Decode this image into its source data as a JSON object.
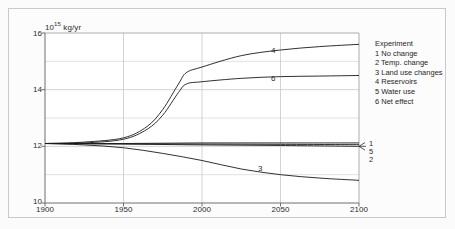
{
  "chart_data": {
    "type": "line",
    "title": "",
    "xlabel": "",
    "ylabel": "10^15 kg/yr",
    "ylabel_mantissa": "10",
    "ylabel_exponent": "15",
    "ylabel_unit": " kg/yr",
    "xlim": [
      1900,
      2100
    ],
    "ylim": [
      10,
      16
    ],
    "xticks": [
      "1900",
      "1950",
      "2000",
      "2050",
      "2100"
    ],
    "xtick_values": [
      1900,
      1950,
      2000,
      2050,
      2100
    ],
    "yticks": [
      "10",
      "12",
      "14",
      "16"
    ],
    "ytick_values": [
      10,
      12,
      14,
      16
    ],
    "yminor_values": [
      11,
      13,
      15
    ],
    "grid": true,
    "legend_position": "right",
    "legend_title": "Experiment",
    "series": [
      {
        "name": "1 No change",
        "number": "1",
        "label_position": "right-brace",
        "x": [
          1900,
          1950,
          2000,
          2050,
          2100
        ],
        "values": [
          12.1,
          12.1,
          12.12,
          12.12,
          12.12
        ]
      },
      {
        "name": "2 Temp. change",
        "number": "2",
        "label_position": "right-brace",
        "x": [
          1900,
          1950,
          2000,
          2050,
          2100
        ],
        "values": [
          12.1,
          12.08,
          12.05,
          12.03,
          12.0
        ]
      },
      {
        "name": "3 Land use changes",
        "number": "3",
        "label_position": "inline",
        "x": [
          1900,
          1925,
          1950,
          1975,
          2000,
          2025,
          2050,
          2075,
          2100
        ],
        "values": [
          12.1,
          12.05,
          11.95,
          11.75,
          11.5,
          11.2,
          11.0,
          10.88,
          10.8
        ]
      },
      {
        "name": "4 Reservoirs",
        "number": "4",
        "label_position": "inline",
        "x": [
          1900,
          1925,
          1950,
          1965,
          1975,
          1985,
          1990,
          2000,
          2025,
          2050,
          2075,
          2100
        ],
        "values": [
          12.1,
          12.15,
          12.3,
          12.7,
          13.3,
          14.2,
          14.6,
          14.8,
          15.2,
          15.4,
          15.52,
          15.6
        ]
      },
      {
        "name": "5 Water use",
        "number": "5",
        "label_position": "right-brace",
        "x": [
          1900,
          1950,
          2000,
          2050,
          2100
        ],
        "values": [
          12.1,
          12.09,
          12.08,
          12.07,
          12.06
        ]
      },
      {
        "name": "6 Net effect",
        "number": "6",
        "label_position": "inline",
        "x": [
          1900,
          1925,
          1950,
          1965,
          1975,
          1985,
          1990,
          2000,
          2025,
          2050,
          2075,
          2100
        ],
        "values": [
          12.1,
          12.12,
          12.25,
          12.6,
          13.1,
          13.9,
          14.2,
          14.28,
          14.4,
          14.46,
          14.48,
          14.5
        ]
      }
    ],
    "annotations": [
      {
        "text": "4",
        "x": 2028,
        "y": 15.33
      },
      {
        "text": "6",
        "x": 2028,
        "y": 14.55
      },
      {
        "text": "3",
        "x": 2020,
        "y": 11.22
      }
    ],
    "right_brace_labels": [
      "1",
      "5",
      "2"
    ],
    "colors": {
      "curve": "#1a1a1a",
      "grid": "#d0d0d0",
      "axis": "#808080",
      "text": "#2b2b2b",
      "plot_background": "#ffffff",
      "figure_background": "#fcfcfc",
      "frame_border": "#c9c9c9"
    }
  },
  "legend": {
    "title": "Experiment",
    "items": [
      "1 No change",
      "2 Temp. change",
      "3 Land use changes",
      "4 Reservoirs",
      "5 Water use",
      "6 Net effect"
    ]
  },
  "axes": {
    "y_unit_mantissa": "10",
    "y_unit_exponent": "15",
    "y_unit_rest": " kg/yr",
    "yticks": [
      "16",
      "14",
      "12",
      "10"
    ],
    "xticks": [
      "1900",
      "1950",
      "2000",
      "2050",
      "2100"
    ]
  },
  "inline_labels": {
    "four": "4",
    "six": "6",
    "three": "3"
  },
  "brace_labels": {
    "one": "1",
    "five": "5",
    "two": "2"
  }
}
